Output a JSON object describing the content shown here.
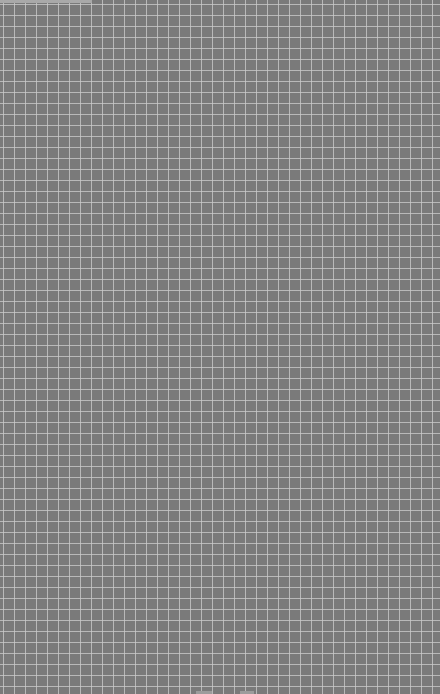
{
  "canvas": {
    "background_color": "#7a7a7a",
    "grid_line_color": "#cdcdcd",
    "grid_pitch_px": 11
  }
}
